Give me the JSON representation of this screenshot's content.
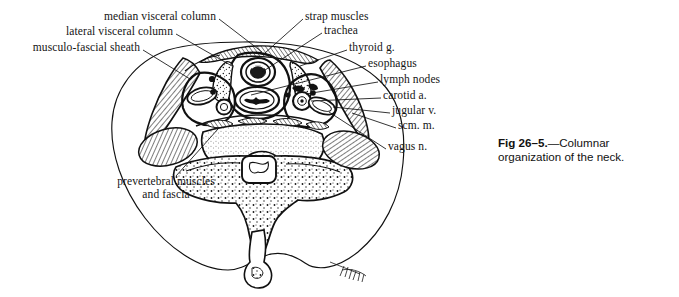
{
  "figure": {
    "caption_number": "Fig 26–5.",
    "caption_dash": "—",
    "caption_text": "Columnar organization",
    "caption_text_line2": "of the neck.",
    "title": "Columnar organization of the neck",
    "ink_color": "#111111",
    "background_color": "#ffffff"
  },
  "labels": {
    "left": [
      {
        "id": "median-visceral-column",
        "text": "median visceral column",
        "x": 216,
        "y": 16,
        "lead_to_x": 258,
        "lead_to_y": 47
      },
      {
        "id": "lateral-visceral-column",
        "text": "lateral visceral column",
        "x": 173,
        "y": 31,
        "lead_to_x": 228,
        "lead_to_y": 62
      },
      {
        "id": "musculo-fascial-sheath",
        "text": "musculo-fascial sheath",
        "x": 140,
        "y": 47,
        "lead_to_x": 186,
        "lead_to_y": 76
      }
    ],
    "right": [
      {
        "id": "strap-muscles",
        "text": "strap muscles",
        "x": 305,
        "y": 16,
        "lead_to_x": 262,
        "lead_to_y": 52
      },
      {
        "id": "trachea",
        "text": "trachea",
        "x": 324,
        "y": 30,
        "lead_to_x": 255,
        "lead_to_y": 70
      },
      {
        "id": "thyroid-g",
        "text": "thyroid g.",
        "x": 349,
        "y": 47,
        "lead_to_x": 296,
        "lead_to_y": 66
      },
      {
        "id": "esophagus",
        "text": "esophagus",
        "x": 368,
        "y": 63,
        "lead_to_x": 247,
        "lead_to_y": 92
      },
      {
        "id": "lymph-nodes",
        "text": "lymph nodes",
        "x": 380,
        "y": 79,
        "lead_to_x": 300,
        "lead_to_y": 96
      },
      {
        "id": "carotid-a",
        "text": "carotid a.",
        "x": 383,
        "y": 95,
        "lead_to_x": 305,
        "lead_to_y": 102
      },
      {
        "id": "jugular-v",
        "text": "jugular v.",
        "x": 392,
        "y": 110,
        "lead_to_x": 325,
        "lead_to_y": 104
      },
      {
        "id": "scm-m",
        "text": "scm. m.",
        "x": 398,
        "y": 125,
        "lead_to_x": 335,
        "lead_to_y": 110
      },
      {
        "id": "vagus-n",
        "text": "vagus n.",
        "x": 388,
        "y": 146,
        "lead_to_x": 330,
        "lead_to_y": 116
      }
    ],
    "bottom": [
      {
        "id": "prevertebral-muscles-and-fascia",
        "text_line1": "prevertebral muscles",
        "text_line2": "and fascia",
        "x": 166,
        "y": 181,
        "lead_to_x": 214,
        "lead_to_y": 129
      }
    ]
  },
  "anatomy": {
    "structures": [
      "neck outline",
      "median visceral column",
      "lateral visceral column",
      "musculo-fascial sheath",
      "strap muscles",
      "trachea",
      "thyroid gland",
      "esophagus",
      "lymph nodes",
      "carotid artery",
      "jugular vein",
      "sternocleidomastoid muscle",
      "vagus nerve",
      "prevertebral muscles and fascia",
      "vertebral body",
      "spinal cord",
      "spinous process",
      "trapezius muscle"
    ],
    "artist_signature": "artist signature"
  }
}
